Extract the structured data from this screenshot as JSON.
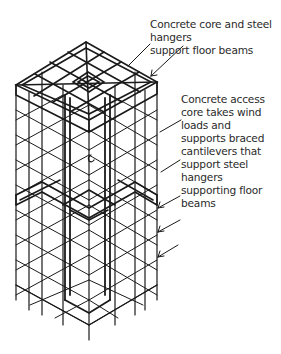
{
  "figure": {
    "type": "isometric structural diagram"
  },
  "labels": {
    "top_label": "Concrete core and steel hangers\nsupport floor beams",
    "core_label": "Concrete access\ncore takes wind\nloads and\nsupports braced\ncantilevers that\nsupport steel\nhangers\nsupporting floor\nbeams"
  },
  "colors": {
    "line": "#1a1a1a",
    "text": "#2a2a2a",
    "background": "#ffffff"
  }
}
